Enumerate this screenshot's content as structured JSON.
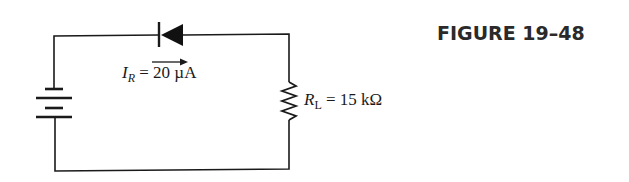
{
  "figure": {
    "title": "FIGURE 19–48"
  },
  "circuit": {
    "components": [
      {
        "type": "dc-source",
        "name": "battery",
        "position": "left branch"
      },
      {
        "type": "diode",
        "name": "diode",
        "orientation": "cathode-left (reverse biased)",
        "position": "top branch"
      },
      {
        "type": "resistor",
        "name": "load-resistor",
        "position": "right branch"
      }
    ],
    "current_label": {
      "symbol": "I",
      "subscript": "R",
      "equals": " = ",
      "value": "20",
      "unit": " µA",
      "arrow_direction": "right"
    },
    "resistor_label": {
      "symbol": "R",
      "subscript": "L",
      "equals": " = ",
      "value": "15",
      "unit": " kΩ"
    }
  },
  "colors": {
    "line": "#1a1a1a",
    "background": "#ffffff"
  }
}
